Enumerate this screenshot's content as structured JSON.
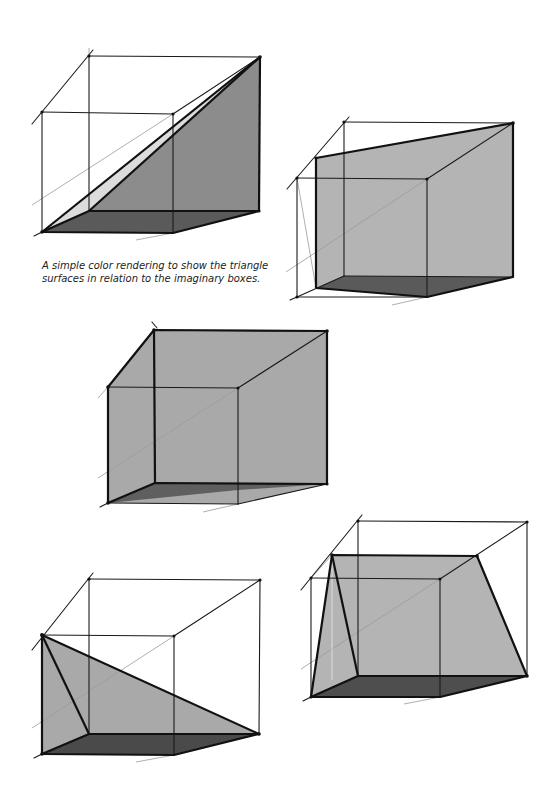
{
  "caption": {
    "text": "A simple color rendering   to show the triangle surfaces in relation to the imaginary boxes."
  },
  "colors": {
    "light_face": "#dcdcdc",
    "mid_face": "#a9a9a9",
    "dark_floor": "#5a5a5a",
    "line": "#1a1a1a",
    "guide_line": "#9a9a9a",
    "background": "#ffffff"
  },
  "figures": [
    {
      "id": "figure-1",
      "description": "Box with diagonal triangular plane rising from front-bottom-left to back-top-right"
    },
    {
      "id": "figure-2",
      "description": "Box with sloped rectangular plane inclined toward back-top-right"
    },
    {
      "id": "figure-3",
      "description": "Box with back and left walls shaded"
    },
    {
      "id": "figure-4",
      "description": "Box with triangular plane descending from front-top-left to back-bottom-right"
    },
    {
      "id": "figure-5",
      "description": "Box containing a trapezoidal tent-like plane"
    }
  ]
}
